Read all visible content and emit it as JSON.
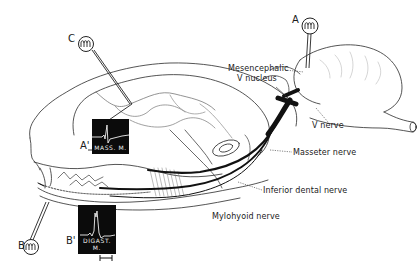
{
  "figure": {
    "colors": {
      "ink": "#1a1a1a",
      "nerve": "#111111",
      "scope_bg": "#0b0b0b",
      "trace": "#f0f0f0",
      "background": "#ffffff"
    }
  },
  "electrodes": [
    {
      "id": "A",
      "label": "A",
      "target": "Mesencephalic V nucleus"
    },
    {
      "id": "B",
      "label": "B",
      "target": "mandible / inferior dental nerve"
    },
    {
      "id": "C",
      "label": "C",
      "target": "cortex"
    }
  ],
  "recordings": [
    {
      "id": "A_prime",
      "marker": "A'",
      "caption": "MASS. M."
    },
    {
      "id": "B_prime",
      "marker": "B'",
      "caption": "DIGAST. M."
    }
  ],
  "labels": {
    "mesencephalic": "Mesencephalic",
    "v_nucleus": "V nucleus",
    "v_nerve": "V nerve",
    "masseter_nerve": "Masseter nerve",
    "inferior_dental_nerve": "Inferior dental nerve",
    "mylohyoid_nerve": "Mylohyoid nerve"
  },
  "scale_bar": {
    "present": true
  }
}
